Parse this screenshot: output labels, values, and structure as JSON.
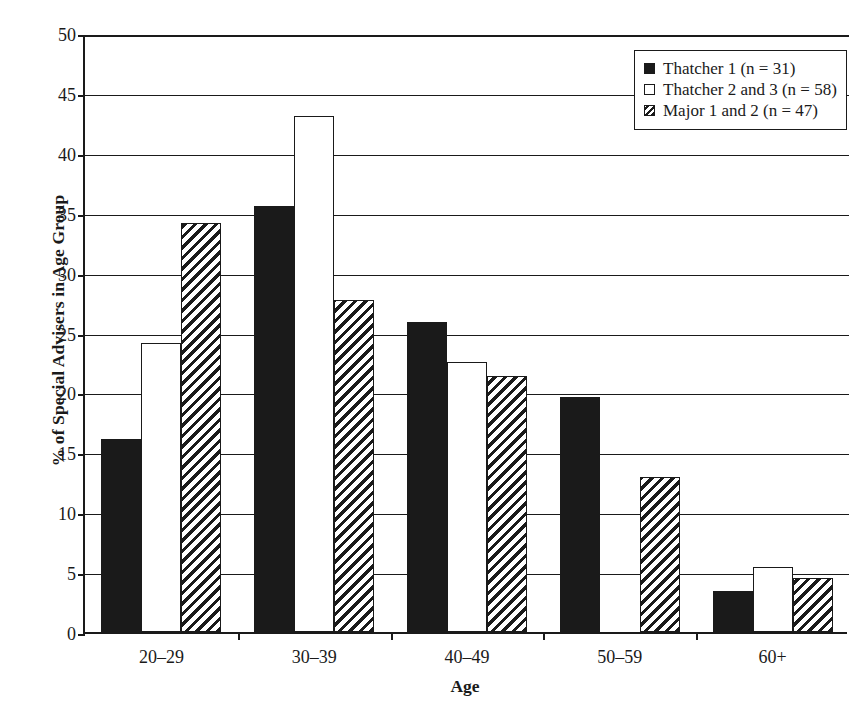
{
  "chart_data": {
    "type": "bar",
    "title": "",
    "xlabel": "Age",
    "ylabel": "% of Special Advisers in Age Group",
    "categories": [
      "20–29",
      "30–39",
      "40–49",
      "50–59",
      "60+"
    ],
    "ylim": [
      0,
      50
    ],
    "ytick_labels": [
      "0",
      "5",
      "10",
      "15",
      "20",
      "25",
      "30",
      "35",
      "40",
      "45",
      "50"
    ],
    "ytick_values": [
      0,
      5,
      10,
      15,
      20,
      25,
      30,
      35,
      40,
      45,
      50
    ],
    "grid": "horizontal",
    "legend_position": "top-right",
    "series": [
      {
        "name": "Thatcher 1 (n = 31)",
        "fill": "solid-black",
        "values": [
          16.1,
          35.6,
          25.9,
          19.6,
          3.4
        ]
      },
      {
        "name": "Thatcher 2 and 3 (n = 58)",
        "fill": "white",
        "values": [
          24.1,
          43.1,
          22.5,
          0.0,
          5.4
        ]
      },
      {
        "name": "Major 1 and 2 (n = 47)",
        "fill": "diagonal-hatch",
        "values": [
          34.1,
          27.7,
          21.4,
          12.9,
          4.5
        ]
      }
    ]
  },
  "colors": {
    "ink": "#1a1a1a",
    "background": "#ffffff"
  }
}
